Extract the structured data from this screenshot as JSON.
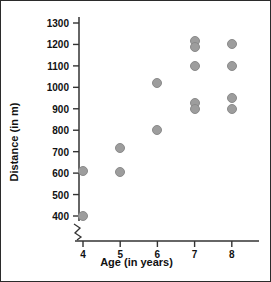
{
  "chart_data": {
    "type": "scatter",
    "title": "",
    "xlabel": "Age (in years)",
    "ylabel": "Distance (in m)",
    "x_ticks": [
      4,
      5,
      6,
      7,
      8
    ],
    "y_ticks": [
      400,
      500,
      600,
      700,
      800,
      900,
      1000,
      1100,
      1200,
      1300
    ],
    "xlim": [
      3.5,
      8.6
    ],
    "ylim": [
      370,
      1330
    ],
    "y_axis_break": true,
    "grid": false,
    "legend": null,
    "marker_color": "#9d9d9d",
    "points": [
      {
        "x": 4,
        "y": 610
      },
      {
        "x": 4,
        "y": 400
      },
      {
        "x": 5,
        "y": 715
      },
      {
        "x": 5,
        "y": 605
      },
      {
        "x": 6,
        "y": 1020
      },
      {
        "x": 6,
        "y": 800
      },
      {
        "x": 7,
        "y": 1215
      },
      {
        "x": 7,
        "y": 1190
      },
      {
        "x": 7,
        "y": 1100
      },
      {
        "x": 7,
        "y": 925
      },
      {
        "x": 7,
        "y": 900
      },
      {
        "x": 8,
        "y": 1200
      },
      {
        "x": 8,
        "y": 1100
      },
      {
        "x": 8,
        "y": 950
      },
      {
        "x": 8,
        "y": 900
      }
    ]
  },
  "colors": {
    "marker": "#9d9d9d",
    "axis": "#333333",
    "text": "#111111",
    "background": "#ffffff",
    "border": "#2b2b2b"
  }
}
